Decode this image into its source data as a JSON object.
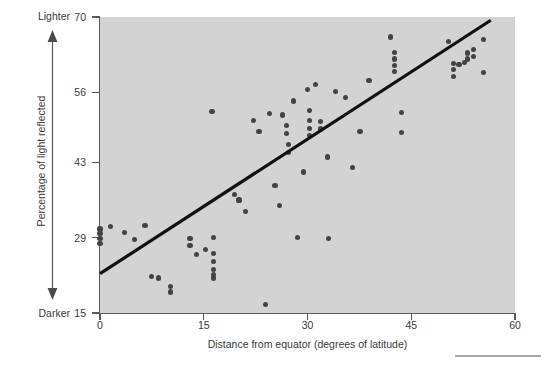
{
  "chart_data": {
    "type": "scatter",
    "title": "",
    "xlabel": "Distance from equator (degrees of latitude)",
    "ylabel": "Percentage of light reflected",
    "xlim": [
      0,
      60
    ],
    "ylim": [
      15,
      70
    ],
    "xticks": [
      0,
      15,
      30,
      45,
      60
    ],
    "yticks": [
      15,
      29,
      43,
      56,
      70
    ],
    "grid": false,
    "legend": null,
    "axis_annotations": {
      "y_top": "Lighter",
      "y_bottom": "Darker",
      "arrow": "double-headed-vertical-arrow"
    },
    "colors": {
      "panel_background": "#d3d3d3",
      "point": "#434345",
      "fit_line": "#111111",
      "axis": "#58585a",
      "text": "#3a3a3a",
      "page_background": "#ffffff"
    },
    "fit_line": {
      "type": "linear-regression",
      "x_start": 0,
      "y_start": 22.3,
      "x_end": 56.5,
      "y_end": 69.4
    },
    "points": [
      {
        "x": 0.0,
        "y": 30.6
      },
      {
        "x": 0.0,
        "y": 29.7
      },
      {
        "x": 0.0,
        "y": 28.9
      },
      {
        "x": 0.0,
        "y": 27.9
      },
      {
        "x": 1.5,
        "y": 31.0
      },
      {
        "x": 3.6,
        "y": 30.0
      },
      {
        "x": 5.0,
        "y": 28.6
      },
      {
        "x": 6.5,
        "y": 31.2
      },
      {
        "x": 7.5,
        "y": 21.8
      },
      {
        "x": 8.4,
        "y": 21.5
      },
      {
        "x": 10.2,
        "y": 19.9
      },
      {
        "x": 10.2,
        "y": 18.9
      },
      {
        "x": 13.0,
        "y": 28.9
      },
      {
        "x": 13.0,
        "y": 27.5
      },
      {
        "x": 14.0,
        "y": 25.8
      },
      {
        "x": 15.2,
        "y": 26.8
      },
      {
        "x": 16.2,
        "y": 52.5
      },
      {
        "x": 16.4,
        "y": 29.0
      },
      {
        "x": 16.4,
        "y": 26.0
      },
      {
        "x": 16.4,
        "y": 24.6
      },
      {
        "x": 16.4,
        "y": 23.1
      },
      {
        "x": 16.4,
        "y": 22.2
      },
      {
        "x": 16.4,
        "y": 21.5
      },
      {
        "x": 19.5,
        "y": 37.0
      },
      {
        "x": 20.1,
        "y": 36.0
      },
      {
        "x": 21.0,
        "y": 33.9
      },
      {
        "x": 22.2,
        "y": 50.8
      },
      {
        "x": 23.0,
        "y": 48.7
      },
      {
        "x": 23.9,
        "y": 16.6
      },
      {
        "x": 24.5,
        "y": 52.0
      },
      {
        "x": 25.3,
        "y": 38.7
      },
      {
        "x": 26.0,
        "y": 34.9
      },
      {
        "x": 26.4,
        "y": 51.8
      },
      {
        "x": 27.0,
        "y": 49.9
      },
      {
        "x": 27.0,
        "y": 48.3
      },
      {
        "x": 27.3,
        "y": 46.3
      },
      {
        "x": 27.3,
        "y": 44.8
      },
      {
        "x": 28.0,
        "y": 54.4
      },
      {
        "x": 28.5,
        "y": 29.0
      },
      {
        "x": 29.4,
        "y": 41.2
      },
      {
        "x": 30.0,
        "y": 56.6
      },
      {
        "x": 30.3,
        "y": 52.6
      },
      {
        "x": 30.3,
        "y": 50.7
      },
      {
        "x": 30.3,
        "y": 49.3
      },
      {
        "x": 30.3,
        "y": 48.0
      },
      {
        "x": 31.2,
        "y": 57.4
      },
      {
        "x": 31.9,
        "y": 50.6
      },
      {
        "x": 31.9,
        "y": 49.2
      },
      {
        "x": 32.9,
        "y": 44.0
      },
      {
        "x": 33.0,
        "y": 28.8
      },
      {
        "x": 34.1,
        "y": 56.2
      },
      {
        "x": 35.5,
        "y": 55.1
      },
      {
        "x": 36.5,
        "y": 42.1
      },
      {
        "x": 37.6,
        "y": 48.7
      },
      {
        "x": 38.9,
        "y": 58.2
      },
      {
        "x": 42.0,
        "y": 66.3
      },
      {
        "x": 42.6,
        "y": 63.4
      },
      {
        "x": 42.6,
        "y": 62.2
      },
      {
        "x": 42.6,
        "y": 61.0
      },
      {
        "x": 42.6,
        "y": 59.9
      },
      {
        "x": 43.6,
        "y": 52.3
      },
      {
        "x": 43.6,
        "y": 48.5
      },
      {
        "x": 50.4,
        "y": 65.5
      },
      {
        "x": 51.1,
        "y": 61.4
      },
      {
        "x": 51.1,
        "y": 60.3
      },
      {
        "x": 51.1,
        "y": 58.9
      },
      {
        "x": 51.9,
        "y": 61.2
      },
      {
        "x": 52.7,
        "y": 61.5
      },
      {
        "x": 53.1,
        "y": 63.3
      },
      {
        "x": 53.1,
        "y": 62.2
      },
      {
        "x": 54.0,
        "y": 63.9
      },
      {
        "x": 54.0,
        "y": 62.7
      },
      {
        "x": 55.4,
        "y": 65.8
      },
      {
        "x": 55.4,
        "y": 59.7
      }
    ]
  }
}
